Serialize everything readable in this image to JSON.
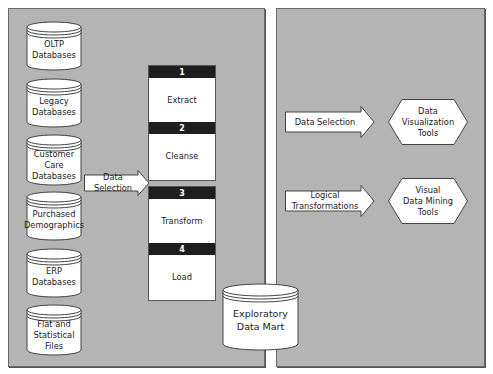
{
  "diagram": {
    "type": "data-warehouse-etl-flow",
    "left_panel": {
      "sources": [
        {
          "label": "OLTP\nDatabases"
        },
        {
          "label": "Legacy\nDatabases"
        },
        {
          "label": "Customer\nCare\nDatabases"
        },
        {
          "label": "Purchased\nDemographics"
        },
        {
          "label": "ERP\nDatabases"
        },
        {
          "label": "Flat and\nStatistical\nFiles"
        }
      ],
      "arrow_label": "Data Selection",
      "steps": [
        {
          "num": "1",
          "label": "Extract"
        },
        {
          "num": "2",
          "label": "Cleanse"
        },
        {
          "num": "3",
          "label": "Transform"
        },
        {
          "num": "4",
          "label": "Load"
        }
      ]
    },
    "center": {
      "data_mart_label": "Exploratory\nData Mart"
    },
    "right_panel": {
      "rows": [
        {
          "arrow_label": "Data Selection",
          "tool_label": "Data\nVisualization\nTools"
        },
        {
          "arrow_label": "Logical\nTransformations",
          "tool_label": "Visual\nData Mining\nTools"
        }
      ]
    },
    "colors": {
      "panel_bg": "#b4b4b4",
      "shape_fill": "#ffffff",
      "step_header": "#1e1e1e",
      "outline": "#555555"
    }
  }
}
